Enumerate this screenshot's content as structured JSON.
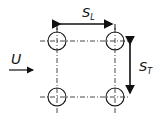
{
  "diagram": {
    "type": "tube-bank-inline-arrangement",
    "labels": {
      "flow_velocity": "U",
      "longitudinal_pitch": {
        "main": "S",
        "sub": "L"
      },
      "transverse_pitch": {
        "main": "S",
        "sub": "T"
      }
    },
    "tubes": {
      "rows": 2,
      "columns": 2
    },
    "colors": {
      "stroke": "#111111",
      "background": "#ffffff"
    }
  }
}
